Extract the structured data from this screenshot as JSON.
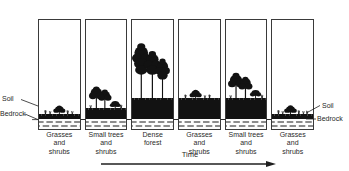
{
  "figure": {
    "title_visible": false,
    "time_axis": {
      "label": "Time",
      "arrow_direction": "right",
      "arrow_icon": "arrow-right-icon"
    },
    "callouts": {
      "soil_left": "Soil",
      "bedrock_left": "Bedrock",
      "soil_right": "Soil",
      "bedrock_right": "Bedrock"
    },
    "layers": {
      "soil_color": "#121212",
      "bedrock_color": "#fdfdfd",
      "outline_color": "#3a3a3a"
    },
    "panels": [
      {
        "letter": "A",
        "caption": "Grasses\nand\nshrubs",
        "soil_thickness": "thin",
        "vegetation": "grasses-and-shrubs"
      },
      {
        "letter": "B",
        "caption": "Small trees\nand\nshrubs",
        "soil_thickness": "medium",
        "vegetation": "small-trees-and-shrubs"
      },
      {
        "letter": "C",
        "caption": "Dense\nforest",
        "soil_thickness": "thick",
        "vegetation": "dense-forest"
      },
      {
        "letter": "D",
        "caption": "Grasses\nand\nshrubs",
        "soil_thickness": "thick",
        "vegetation": "grasses-and-shrubs"
      },
      {
        "letter": "E",
        "caption": "Small trees\nand\nshrubs",
        "soil_thickness": "thick",
        "vegetation": "small-trees-and-shrubs"
      },
      {
        "letter": "F",
        "caption": "Grasses\nand\nshrubs",
        "soil_thickness": "thin",
        "vegetation": "grasses-and-shrubs"
      }
    ]
  }
}
